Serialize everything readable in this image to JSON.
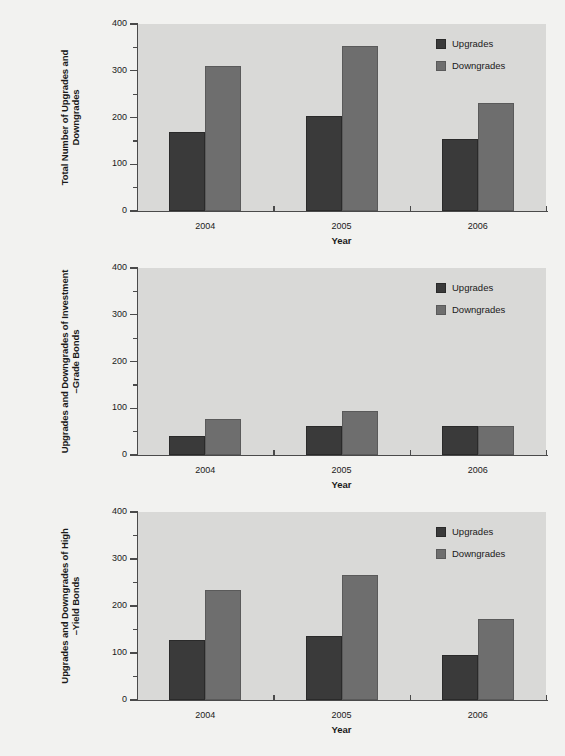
{
  "legend": {
    "series": [
      {
        "key": "upgrades",
        "label": "Upgrades",
        "color": "#3a3a3a"
      },
      {
        "key": "downgrades",
        "label": "Downgrades",
        "color": "#6e6e6e"
      }
    ]
  },
  "axis": {
    "y_ticks": [
      "0",
      "100",
      "200",
      "300",
      "400"
    ],
    "x_ticks": [
      "2004",
      "2005",
      "2006"
    ],
    "x_title": "Year"
  },
  "panels": [
    {
      "id": "panel-total",
      "ylabel": "Total Number of Upgrades and Downgrades",
      "ylabel_line1": "Total Number of Upgrades and Downgrades",
      "ylabel_line2": ""
    },
    {
      "id": "panel-investment-grade",
      "ylabel": "Upgrades and Downgrades of Investment\n–Grade Bonds",
      "ylabel_line1": "Upgrades and Downgrades of Investment",
      "ylabel_line2": "–Grade Bonds"
    },
    {
      "id": "panel-high-yield",
      "ylabel": "Upgrades and Downgrades of High\n–Yield Bonds",
      "ylabel_line1": "Upgrades and Downgrades of High",
      "ylabel_line2": "–Yield Bonds"
    }
  ],
  "chart_data": [
    {
      "type": "bar",
      "title": "",
      "ylabel": "Total Number of Upgrades and Downgrades",
      "xlabel": "Year",
      "categories": [
        "2004",
        "2005",
        "2006"
      ],
      "series": [
        {
          "name": "Upgrades",
          "values": [
            168,
            203,
            153
          ],
          "color": "#3a3a3a"
        },
        {
          "name": "Downgrades",
          "values": [
            311,
            352,
            232
          ],
          "color": "#6e6e6e"
        }
      ],
      "ylim": [
        0,
        400
      ],
      "yticks": [
        0,
        100,
        200,
        300,
        400
      ],
      "grid": false,
      "legend_position": "top-right"
    },
    {
      "type": "bar",
      "title": "",
      "ylabel": "Upgrades and Downgrades of Investment–Grade Bonds",
      "xlabel": "Year",
      "categories": [
        "2004",
        "2005",
        "2006"
      ],
      "series": [
        {
          "name": "Upgrades",
          "values": [
            41,
            61,
            61
          ],
          "color": "#3a3a3a"
        },
        {
          "name": "Downgrades",
          "values": [
            78,
            95,
            62
          ],
          "color": "#6e6e6e"
        }
      ],
      "ylim": [
        0,
        400
      ],
      "yticks": [
        0,
        100,
        200,
        300,
        400
      ],
      "grid": false,
      "legend_position": "top-right"
    },
    {
      "type": "bar",
      "title": "",
      "ylabel": "Upgrades and Downgrades of High–Yield Bonds",
      "xlabel": "Year",
      "categories": [
        "2004",
        "2005",
        "2006"
      ],
      "series": [
        {
          "name": "Upgrades",
          "values": [
            127,
            137,
            95
          ],
          "color": "#3a3a3a"
        },
        {
          "name": "Downgrades",
          "values": [
            235,
            265,
            172
          ],
          "color": "#6e6e6e"
        }
      ],
      "ylim": [
        0,
        400
      ],
      "yticks": [
        0,
        100,
        200,
        300,
        400
      ],
      "grid": false,
      "legend_position": "top-right"
    }
  ]
}
